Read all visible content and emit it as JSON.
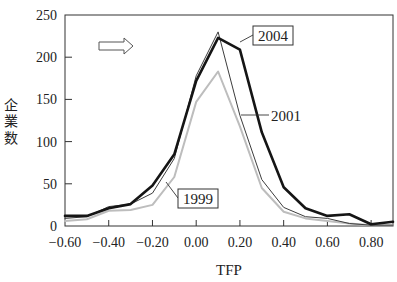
{
  "chart_data": {
    "type": "line",
    "title": "",
    "xlabel": "TFP",
    "ylabel": "企業数",
    "x": [
      -0.6,
      -0.5,
      -0.4,
      -0.3,
      -0.2,
      -0.1,
      0.0,
      0.1,
      0.2,
      0.3,
      0.4,
      0.5,
      0.6,
      0.7,
      0.8,
      0.9
    ],
    "xlim": [
      -0.6,
      0.9
    ],
    "ylim": [
      0,
      250
    ],
    "xticks": [
      -0.6,
      -0.4,
      -0.2,
      0.0,
      0.2,
      0.4,
      0.6,
      0.8
    ],
    "xtick_labels": [
      "−0.60",
      "−0.40",
      "−0.20",
      "0.00",
      "0.20",
      "0.40",
      "0.60",
      "0.80"
    ],
    "yticks": [
      0,
      50,
      100,
      150,
      200,
      250
    ],
    "ytick_labels": [
      "0",
      "50",
      "100",
      "150",
      "200",
      "250"
    ],
    "grid": false,
    "legend": "inline labels",
    "series": [
      {
        "name": "2004",
        "style": "thick-black",
        "color": "#151515",
        "width": 2.6,
        "values": [
          12,
          12,
          21,
          26,
          48,
          85,
          172,
          223,
          209,
          111,
          46,
          21,
          12,
          14,
          2,
          5
        ]
      },
      {
        "name": "2001",
        "style": "thin-dark",
        "color": "#3c3c3c",
        "width": 1.0,
        "values": [
          9,
          11,
          23,
          26,
          39,
          80,
          178,
          230,
          131,
          55,
          22,
          11,
          9,
          3,
          1,
          1
        ]
      },
      {
        "name": "1999",
        "style": "light-gray",
        "color": "#bdbdbd",
        "width": 2.0,
        "values": [
          6,
          8,
          18,
          19,
          25,
          58,
          147,
          183,
          118,
          45,
          17,
          9,
          6,
          3,
          1,
          1
        ]
      }
    ],
    "annotations": [
      {
        "text": "2004",
        "boxed": true,
        "target_series": "2004"
      },
      {
        "text": "2001",
        "boxed": false,
        "target_series": "2001"
      },
      {
        "text": "1999",
        "boxed": true,
        "target_series": "1999"
      },
      {
        "text": "",
        "shape": "right-arrow-outline",
        "meaning": "shift direction"
      }
    ]
  },
  "labels": {
    "xlabel": "TFP",
    "ylabel_chars": [
      "企",
      "業",
      "数"
    ],
    "ann_2004": "2004",
    "ann_2001": "2001",
    "ann_1999": "1999"
  }
}
